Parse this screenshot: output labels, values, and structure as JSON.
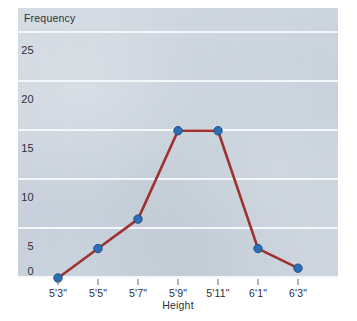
{
  "chart_data": {
    "type": "line",
    "title": "",
    "xlabel": "Height",
    "ylabel": "Frequency",
    "categories": [
      "5'3\"",
      "5'5\"",
      "5'7\"",
      "5'9\"",
      "5'11\"",
      "6'1\"",
      "6'3\""
    ],
    "values": [
      0,
      3,
      6,
      15,
      15,
      3,
      1
    ],
    "series": [
      {
        "name": "Frequency",
        "values": [
          0,
          3,
          6,
          15,
          15,
          3,
          1
        ]
      }
    ],
    "ylim": [
      0,
      27.5
    ],
    "xlim": [
      0,
      8
    ],
    "y_ticks": [
      "0",
      "5",
      "10",
      "15",
      "20",
      "25"
    ],
    "y_tick_values": [
      0,
      5,
      10,
      15,
      20,
      25
    ],
    "grid": true,
    "grid_axis": "y",
    "legend": false,
    "legend_position": "none",
    "marker": "circle",
    "colors": {
      "line": "#9e3230",
      "marker": "#2e6eb4",
      "marker_edge": "#1f4f87",
      "plot_background": "#ccd5de",
      "gridline": "#f4f7fa",
      "text": "#2b3038",
      "page_background": "#ffffff"
    }
  },
  "axes": {
    "y_axis_title": "Frequency",
    "x_axis_title": "Height"
  }
}
